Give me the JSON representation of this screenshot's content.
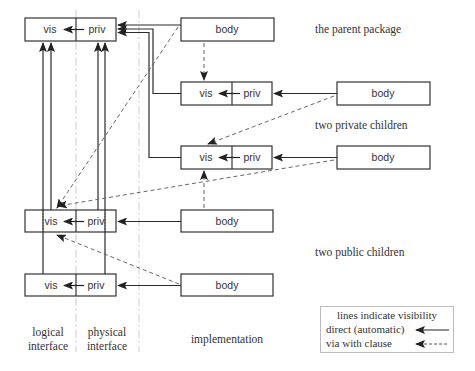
{
  "diagram": {
    "boxes": {
      "parent": {
        "vis": "vis",
        "priv": "priv",
        "body": "body"
      },
      "private_child_1": {
        "vis": "vis",
        "priv": "priv",
        "body": "body"
      },
      "private_child_2": {
        "vis": "vis",
        "priv": "priv",
        "body": "body"
      },
      "public_child_1": {
        "vis": "vis",
        "priv": "priv",
        "body": "body"
      },
      "public_child_2": {
        "vis": "vis",
        "priv": "priv",
        "body": "body"
      }
    },
    "row_labels": {
      "parent": "the parent package",
      "private": "two private children",
      "public": "two public children"
    },
    "column_labels": {
      "logical_line1": "logical",
      "logical_line2": "interface",
      "physical_line1": "physical",
      "physical_line2": "interface",
      "implementation": "implementation"
    },
    "legend": {
      "title": "lines indicate visibility",
      "direct": "direct (automatic)",
      "with_clause": "via with clause"
    },
    "colors": {
      "line": "#2b2b2b",
      "dashed": "#666666",
      "divider": "#c8c8c8",
      "legend_border": "#bbbbbb"
    }
  }
}
